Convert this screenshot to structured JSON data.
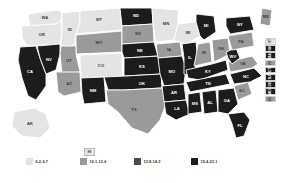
{
  "chart_data": {
    "type": "choropleth",
    "title": "",
    "subtitle": "",
    "region": "United States",
    "grid": false,
    "legend_position": "bottom",
    "palette": {
      "class1": "#e4e4e4",
      "class2": "#9a9a9a",
      "class3": "#4a4a4a",
      "class4": "#1c1c1c",
      "border": "#ffffff",
      "background": "#ffffff"
    },
    "legend": [
      {
        "label": "6.2-9.7",
        "color": "#e4e4e4",
        "min": 6.2,
        "max": 9.7
      },
      {
        "label": "10.1-12.6",
        "color": "#9a9a9a",
        "min": 10.1,
        "max": 12.6
      },
      {
        "label": "12.8-14.2",
        "color": "#4a4a4a",
        "min": 12.8,
        "max": 14.2
      },
      {
        "label": "15.4-23.1",
        "color": "#1c1c1c",
        "min": 15.4,
        "max": 23.1
      }
    ],
    "states": [
      {
        "code": "WA",
        "class": 1
      },
      {
        "code": "OR",
        "class": 1
      },
      {
        "code": "ID",
        "class": 1
      },
      {
        "code": "MT",
        "class": 1
      },
      {
        "code": "ND",
        "class": 4
      },
      {
        "code": "MN",
        "class": 1
      },
      {
        "code": "WI",
        "class": 1
      },
      {
        "code": "MI",
        "class": 4
      },
      {
        "code": "NY",
        "class": 4
      },
      {
        "code": "ME",
        "class": 2
      },
      {
        "code": "CA",
        "class": 4
      },
      {
        "code": "NV",
        "class": 4
      },
      {
        "code": "UT",
        "class": 2
      },
      {
        "code": "WY",
        "class": 2
      },
      {
        "code": "SD",
        "class": 2
      },
      {
        "code": "IA",
        "class": 2
      },
      {
        "code": "IL",
        "class": 4
      },
      {
        "code": "IN",
        "class": 2
      },
      {
        "code": "OH",
        "class": 2
      },
      {
        "code": "PA",
        "class": 2
      },
      {
        "code": "AZ",
        "class": 2
      },
      {
        "code": "CO",
        "class": 1
      },
      {
        "code": "NE",
        "class": 4
      },
      {
        "code": "MO",
        "class": 4
      },
      {
        "code": "KY",
        "class": 4
      },
      {
        "code": "WV",
        "class": 4
      },
      {
        "code": "VA",
        "class": 2
      },
      {
        "code": "NM",
        "class": 4
      },
      {
        "code": "KS",
        "class": 4
      },
      {
        "code": "OK",
        "class": 4
      },
      {
        "code": "AR",
        "class": 4
      },
      {
        "code": "TN",
        "class": 4
      },
      {
        "code": "NC",
        "class": 4
      },
      {
        "code": "TX",
        "class": 2
      },
      {
        "code": "LA",
        "class": 4
      },
      {
        "code": "MS",
        "class": 4
      },
      {
        "code": "AL",
        "class": 4
      },
      {
        "code": "GA",
        "class": 4
      },
      {
        "code": "SC",
        "class": 2
      },
      {
        "code": "FL",
        "class": 4
      },
      {
        "code": "AK",
        "class": 1
      },
      {
        "code": "HI",
        "class": 1
      },
      {
        "code": "VT",
        "class": 1
      },
      {
        "code": "NH",
        "class": 4
      },
      {
        "code": "MA",
        "class": 4
      },
      {
        "code": "RI",
        "class": 2
      },
      {
        "code": "CT",
        "class": 4
      },
      {
        "code": "NJ",
        "class": 4
      },
      {
        "code": "DE",
        "class": 4
      },
      {
        "code": "MD",
        "class": 4
      },
      {
        "code": "DC",
        "class": 2
      }
    ],
    "callouts": [
      {
        "code": "VT",
        "class": 1
      },
      {
        "code": "NH",
        "class": 4
      },
      {
        "code": "MA",
        "class": 4
      },
      {
        "code": "RI",
        "class": 2
      },
      {
        "code": "CT",
        "class": 4
      },
      {
        "code": "NJ",
        "class": 4
      },
      {
        "code": "DE",
        "class": 4
      },
      {
        "code": "MD",
        "class": 4
      },
      {
        "code": "DC",
        "class": 2
      }
    ],
    "inset": {
      "code": "HI",
      "class": 1
    }
  }
}
